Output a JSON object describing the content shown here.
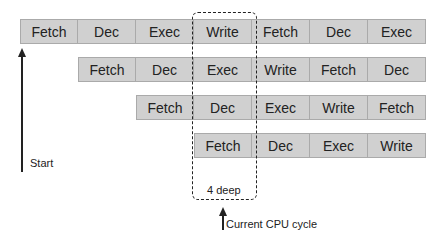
{
  "diagram": {
    "type": "instruction-pipeline",
    "rows": [
      {
        "offset": 0,
        "stages": [
          "Fetch",
          "Dec",
          "Exec",
          "Write",
          "Fetch",
          "Dec",
          "Exec"
        ]
      },
      {
        "offset": 1,
        "stages": [
          "Fetch",
          "Dec",
          "Exec",
          "Write",
          "Fetch",
          "Dec"
        ]
      },
      {
        "offset": 2,
        "stages": [
          "Fetch",
          "Dec",
          "Exec",
          "Write",
          "Fetch"
        ]
      },
      {
        "offset": 3,
        "stages": [
          "Fetch",
          "Dec",
          "Exec",
          "Write"
        ]
      }
    ],
    "labels": {
      "start": "Start",
      "depth": "4 deep",
      "current": "Current CPU cycle"
    },
    "colors": {
      "cell_fill": "#d0d0d0",
      "cell_border": "#aaaaaa",
      "line": "#222222"
    }
  }
}
